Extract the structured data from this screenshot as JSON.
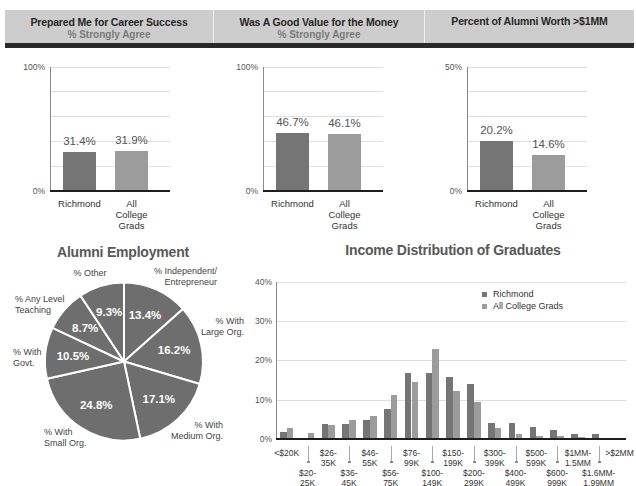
{
  "colors": {
    "header_bg": "#cdcdcd",
    "header_rule": "#2a2a2a",
    "richmond": "#757575",
    "all_college_grads": "#9c9c9c",
    "pie_fill": "#6e6e6e",
    "title_text": "#585858"
  },
  "header": {
    "columns": [
      {
        "title": "Prepared Me for Career Success",
        "subtitle": "% Strongly Agree"
      },
      {
        "title": "Was A Good Value for the Money",
        "subtitle": "% Strongly Agree"
      },
      {
        "title": "Percent of Alumni Worth >$1MM"
      }
    ]
  },
  "sections": {
    "employment_title": "Alumni Employment",
    "income_title": "Income Distribution of Graduates"
  },
  "chart_data": [
    {
      "type": "bar",
      "title": "Prepared Me for Career Success",
      "subtitle": "% Strongly Agree",
      "categories": [
        "Richmond",
        "All College Grads"
      ],
      "category_lines": [
        [
          "Richmond"
        ],
        [
          "All",
          "College",
          "Grads"
        ]
      ],
      "values": [
        31.4,
        31.9
      ],
      "value_labels": [
        "31.4%",
        "31.9%"
      ],
      "ylim": [
        0,
        100
      ],
      "ytick_labels": {
        "min": "0%",
        "max": "100%"
      },
      "grid": true,
      "xlabel": "",
      "ylabel": ""
    },
    {
      "type": "bar",
      "title": "Was A Good Value for the Money",
      "subtitle": "% Strongly Agree",
      "categories": [
        "Richmond",
        "All College Grads"
      ],
      "category_lines": [
        [
          "Richmond"
        ],
        [
          "All",
          "College",
          "Grads"
        ]
      ],
      "values": [
        46.7,
        46.1
      ],
      "value_labels": [
        "46.7%",
        "46.1%"
      ],
      "ylim": [
        0,
        100
      ],
      "ytick_labels": {
        "min": "0%",
        "max": "100%"
      },
      "grid": true,
      "xlabel": "",
      "ylabel": ""
    },
    {
      "type": "bar",
      "title": "Percent of Alumni Worth >$1MM",
      "categories": [
        "Richmond",
        "All College Grads"
      ],
      "category_lines": [
        [
          "Richmond"
        ],
        [
          "All",
          "College",
          "Grads"
        ]
      ],
      "values": [
        20.2,
        14.6
      ],
      "value_labels": [
        "20.2%",
        "14.6%"
      ],
      "ylim": [
        0,
        50
      ],
      "ytick_labels": {
        "min": "0%",
        "max": "50%"
      },
      "grid": true,
      "xlabel": "",
      "ylabel": ""
    },
    {
      "type": "pie",
      "title": "Alumni Employment",
      "labels": [
        "% Independent/ Entrepreneur",
        "% With Large Org.",
        "% With Medium Org.",
        "% With Small Org.",
        "% With Govt.",
        "% Any Level Teaching",
        "% Other"
      ],
      "label_lines": [
        [
          "% Independent/",
          "Entrepreneur"
        ],
        [
          "% With",
          "Large Org."
        ],
        [
          "% With",
          "Medium Org."
        ],
        [
          "% With",
          "Small Org."
        ],
        [
          "% With",
          "Govt."
        ],
        [
          "% Any Level",
          "Teaching"
        ],
        [
          "% Other"
        ]
      ],
      "values": [
        13.4,
        16.2,
        17.1,
        24.8,
        10.5,
        8.7,
        9.3
      ],
      "value_labels": [
        "13.4%",
        "16.2%",
        "17.1%",
        "24.8%",
        "10.5%",
        "8.7%",
        "9.3%"
      ],
      "start_angle": "12 o'clock, clockwise"
    },
    {
      "type": "bar",
      "title": "Income Distribution of Graduates",
      "categories": [
        "<$20K",
        "$20-25K",
        "$26-35K",
        "$36-45K",
        "$46-55K",
        "$56-75K",
        "$76-99K",
        "$100-149K",
        "$150-199K",
        "$200-299K",
        "$300-399K",
        "$400-499K",
        "$500-599K",
        "$600-999K",
        "$1MM-1.5MM",
        "$1.6MM-1.99MM",
        ">$2MM"
      ],
      "category_lines": [
        [
          "<$20K"
        ],
        [
          "$20-",
          "25K"
        ],
        [
          "$26-",
          "35K"
        ],
        [
          "$36-",
          "45K"
        ],
        [
          "$46-",
          "55K"
        ],
        [
          "$56-",
          "75K"
        ],
        [
          "$76-",
          "99K"
        ],
        [
          "$100-",
          "149K"
        ],
        [
          "$150-",
          "199K"
        ],
        [
          "$200-",
          "299K"
        ],
        [
          "$300-",
          "399K"
        ],
        [
          "$400-",
          "499K"
        ],
        [
          "$500-",
          "599K"
        ],
        [
          "$600-",
          "999K"
        ],
        [
          "$1MM-",
          "1.5MM"
        ],
        [
          "$1.6MM-",
          "1.99MM"
        ],
        [
          ">$2MM"
        ]
      ],
      "series": [
        {
          "name": "Richmond",
          "color": "#757575",
          "values": [
            1.8,
            0.0,
            3.7,
            3.7,
            4.8,
            7.7,
            16.7,
            16.7,
            15.8,
            13.9,
            4.0,
            4.0,
            3.0,
            2.2,
            1.2,
            1.2,
            0.3
          ]
        },
        {
          "name": "All College Grads",
          "color": "#9c9c9c",
          "values": [
            2.9,
            1.6,
            3.5,
            4.9,
            5.8,
            11.1,
            14.6,
            23.0,
            12.3,
            9.5,
            2.9,
            1.3,
            0.8,
            0.8,
            0.6,
            0.3,
            0.3
          ]
        }
      ],
      "ylim": [
        0,
        40
      ],
      "ytick_labels": [
        "0%",
        "10%",
        "20%",
        "30%",
        "40%"
      ],
      "grid": true,
      "legend_position": "upper right",
      "xlabel": "",
      "ylabel": ""
    }
  ]
}
